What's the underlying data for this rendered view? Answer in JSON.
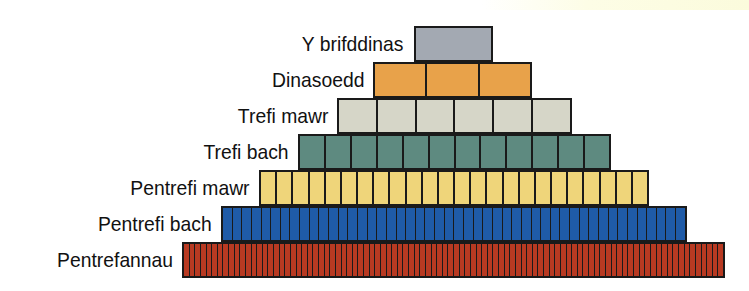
{
  "diagram": {
    "type": "settlement-hierarchy-pyramid",
    "levels": [
      {
        "label": "Y brifddinas",
        "cells": 1,
        "color": "#a3a9b2",
        "x": 414,
        "y": 26,
        "w": 79,
        "label_right": 404
      },
      {
        "label": "Dinasoedd",
        "cells": 3,
        "color": "#e8a24a",
        "x": 373,
        "y": 62,
        "w": 159,
        "label_right": 364
      },
      {
        "label": "Trefi mawr",
        "cells": 6,
        "color": "#d6d6c8",
        "x": 337,
        "y": 98,
        "w": 235,
        "label_right": 328
      },
      {
        "label": "Trefi bach",
        "cells": 12,
        "color": "#5e8a80",
        "x": 298,
        "y": 134,
        "w": 313,
        "label_right": 289
      },
      {
        "label": "Pentrefi mawr",
        "cells": 24,
        "color": "#efd57a",
        "x": 259,
        "y": 170,
        "w": 390,
        "label_right": 250
      },
      {
        "label": "Pentrefi bach",
        "cells": 48,
        "color": "#1f5ba8",
        "x": 221,
        "y": 206,
        "w": 466,
        "label_right": 212
      },
      {
        "label": "Pentrefannau",
        "cells": 96,
        "color": "#b83a22",
        "x": 182,
        "y": 242,
        "w": 543,
        "label_right": 173
      }
    ]
  }
}
